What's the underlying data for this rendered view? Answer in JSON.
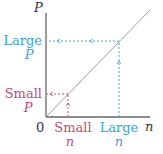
{
  "axes": {
    "y_label": "P",
    "x_label": "n",
    "origin_label": "0"
  },
  "small": {
    "p_label_line1": "Small",
    "p_label_line2": "P",
    "n_label_line1": "Small",
    "n_label_line2": "n",
    "color": "#c9457a"
  },
  "large": {
    "p_label_line1": "Large",
    "p_label_line2": "P",
    "n_label_line1": "Large",
    "n_label_line2": "n",
    "color": "#3aa3d9"
  },
  "colors": {
    "axis": "#555555",
    "diagonal": "#999999"
  }
}
